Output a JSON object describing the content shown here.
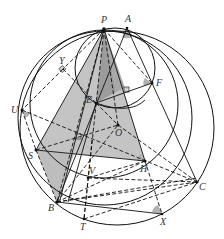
{
  "figure": {
    "type": "geometry-diagram",
    "width": 224,
    "height": 239,
    "colors": {
      "background": "#ffffff",
      "stroke": "#111111",
      "shade_light": "#bdbdbd",
      "shade_dark": "#9a9a9a",
      "angle_mark": "#b0b0b0",
      "label": "#333333"
    },
    "points": [
      {
        "name": "P",
        "x": 104,
        "y": 29,
        "label_dx": -2,
        "label_dy": -6
      },
      {
        "name": "A",
        "x": 127,
        "y": 28,
        "label_dx": -1,
        "label_dy": -6
      },
      {
        "name": "Y",
        "x": 63,
        "y": 69,
        "label_dx": -3,
        "label_dy": -5
      },
      {
        "name": "F",
        "x": 152,
        "y": 83,
        "label_dx": 4,
        "label_dy": 3
      },
      {
        "name": "U",
        "x": 22,
        "y": 110,
        "label_dx": -10,
        "label_dy": 3
      },
      {
        "name": "E",
        "x": 96,
        "y": 103,
        "label_dx": -9,
        "label_dy": 0
      },
      {
        "name": "O",
        "x": 118,
        "y": 125,
        "label_dx": -3,
        "label_dy": 11
      },
      {
        "name": "S",
        "x": 36,
        "y": 150,
        "label_dx": -8,
        "label_dy": 9
      },
      {
        "name": "H",
        "x": 145,
        "y": 161,
        "label_dx": -5,
        "label_dy": 11
      },
      {
        "name": "V",
        "x": 88,
        "y": 178,
        "label_dx": 1,
        "label_dy": -4
      },
      {
        "name": "C",
        "x": 197,
        "y": 182,
        "label_dx": 2,
        "label_dy": 8
      },
      {
        "name": "B",
        "x": 57,
        "y": 202,
        "label_dx": -9,
        "label_dy": 9
      },
      {
        "name": "T",
        "x": 84,
        "y": 219,
        "label_dx": -4,
        "label_dy": 11
      },
      {
        "name": "X",
        "x": 162,
        "y": 214,
        "label_dx": -2,
        "label_dy": 11
      }
    ],
    "circles": [
      {
        "name": "outer-circle",
        "cx": 117,
        "cy": 128,
        "r": 97
      },
      {
        "name": "second-large-circle",
        "cx": 105,
        "cy": 118,
        "r": 86
      },
      {
        "name": "medium-circle",
        "cx": 102,
        "cy": 103,
        "r": 72
      },
      {
        "name": "small-circle",
        "cx": 115,
        "cy": 67,
        "r": 40
      }
    ],
    "labels": [
      "P",
      "A",
      "Y",
      "F",
      "U",
      "E",
      "O",
      "S",
      "H",
      "V",
      "C",
      "B",
      "T",
      "X"
    ]
  }
}
